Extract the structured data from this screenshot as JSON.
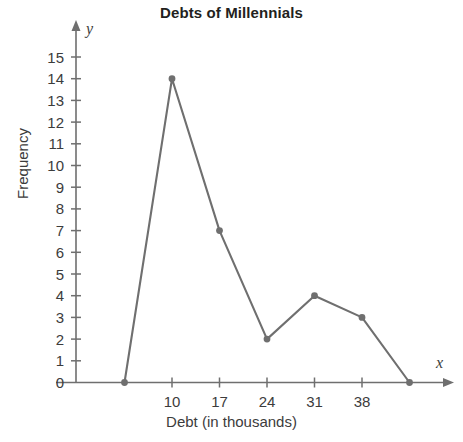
{
  "chart_data": {
    "type": "line",
    "title": "Debts of Millennials",
    "xlabel": "Debt (in thousands)",
    "ylabel": "Frequency",
    "x": [
      3,
      10,
      17,
      24,
      31,
      38,
      45
    ],
    "values": [
      0,
      14,
      7,
      2,
      4,
      3,
      0
    ],
    "points": [
      {
        "x": 3,
        "y": 0
      },
      {
        "x": 10,
        "y": 14
      },
      {
        "x": 17,
        "y": 7
      },
      {
        "x": 24,
        "y": 2
      },
      {
        "x": 31,
        "y": 4
      },
      {
        "x": 38,
        "y": 3
      },
      {
        "x": 45,
        "y": 0
      }
    ],
    "xlim": [
      0,
      48
    ],
    "ylim": [
      0,
      15
    ],
    "x_tick_labels": [
      "10",
      "17",
      "24",
      "31",
      "38"
    ],
    "x_tick_values": [
      10,
      17,
      24,
      31,
      38
    ],
    "y_tick_labels": [
      "0",
      "1",
      "2",
      "3",
      "4",
      "5",
      "6",
      "7",
      "8",
      "9",
      "10",
      "11",
      "12",
      "13",
      "14",
      "15"
    ],
    "y_tick_values": [
      0,
      1,
      2,
      3,
      4,
      5,
      6,
      7,
      8,
      9,
      10,
      11,
      12,
      13,
      14,
      15
    ],
    "grid": false,
    "legend": "none",
    "markers": "filled-circle",
    "series_color": "#6f6f6f",
    "axis_color": "#6f6f6f",
    "background_color": "#ffffff",
    "x_axis_variable": "x",
    "y_axis_variable": "y"
  }
}
